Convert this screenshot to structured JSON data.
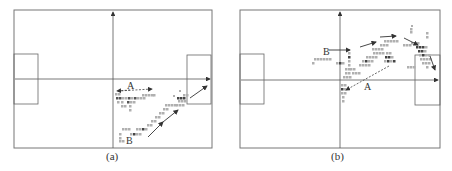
{
  "figure": {
    "panels": [
      {
        "id": "a",
        "caption": "(a)",
        "labels": {
          "A": "A",
          "B": "B"
        },
        "frame": {
          "x": 14,
          "y": 10,
          "w": 198,
          "h": 138
        },
        "axis_origin": {
          "x": 113,
          "y": 79
        },
        "left_box": {
          "x": 14,
          "y": 54,
          "w": 24,
          "h": 50
        },
        "right_box": {
          "x": 187,
          "y": 55,
          "w": 24,
          "h": 49
        }
      },
      {
        "id": "b",
        "caption": "(b)",
        "labels": {
          "A": "A",
          "B": "B"
        },
        "frame": {
          "x": 240,
          "y": 10,
          "w": 200,
          "h": 138
        },
        "axis_origin": {
          "x": 340,
          "y": 80
        },
        "left_box": {
          "x": 240,
          "y": 54,
          "w": 24,
          "h": 50
        },
        "right_box": {
          "x": 415,
          "y": 55,
          "w": 25,
          "h": 50
        }
      }
    ],
    "colors": {
      "line": "#555555",
      "marker_light": "#b0b0b0",
      "marker_dark": "#444444",
      "text": "#333333"
    }
  }
}
